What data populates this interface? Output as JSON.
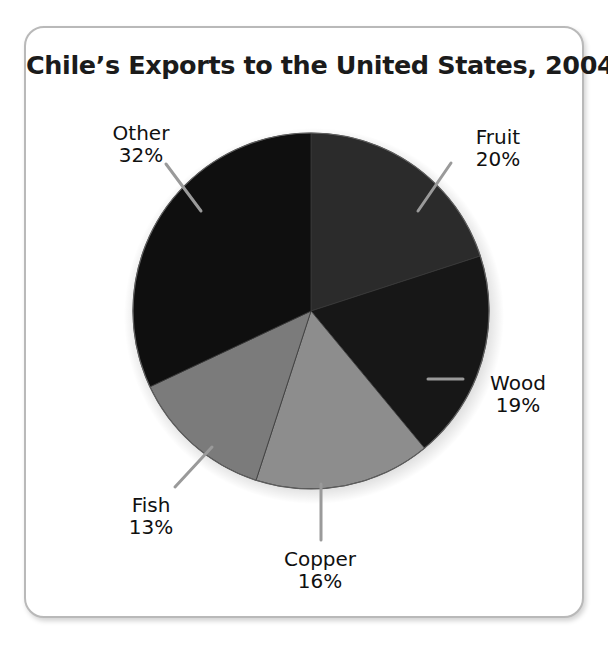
{
  "card": {
    "title": "Chile’s Exports to the United States, 2004"
  },
  "chart_data": {
    "type": "pie",
    "title": "Chile’s Exports to the United States, 2004",
    "xlabel": "",
    "ylabel": "",
    "unit": "percent",
    "start_angle_deg": 0,
    "direction": "clockwise",
    "legend": "none",
    "grid": false,
    "categories": [
      "Fruit",
      "Wood",
      "Copper",
      "Fish",
      "Other"
    ],
    "values": [
      20,
      19,
      16,
      13,
      32
    ],
    "labels": [
      "20%",
      "19%",
      "16%",
      "13%",
      "32%"
    ],
    "colors": [
      "#2b2b2b",
      "#171717",
      "#8d8d8d",
      "#7b7b7b",
      "#0f0f0f"
    ],
    "slices": [
      {
        "name": "Fruit",
        "value": 20,
        "label": "20%",
        "color": "#2b2b2b",
        "start_deg": 0,
        "end_deg": 72
      },
      {
        "name": "Wood",
        "value": 19,
        "label": "19%",
        "color": "#171717",
        "start_deg": 72,
        "end_deg": 140.4
      },
      {
        "name": "Copper",
        "value": 16,
        "label": "16%",
        "color": "#8d8d8d",
        "start_deg": 140.4,
        "end_deg": 197.999
      },
      {
        "name": "Fish",
        "value": 13,
        "label": "13%",
        "color": "#7b7b7b",
        "start_deg": 198,
        "end_deg": 244.8
      },
      {
        "name": "Other",
        "value": 32,
        "label": "32%",
        "color": "#0f0f0f",
        "start_deg": 244.8,
        "end_deg": 360
      }
    ],
    "total": 100
  },
  "labels": {
    "other": {
      "name": "Other",
      "pct": "32%"
    },
    "fruit": {
      "name": "Fruit",
      "pct": "20%"
    },
    "wood": {
      "name": "Wood",
      "pct": "19%"
    },
    "copper": {
      "name": "Copper",
      "pct": "16%"
    },
    "fish": {
      "name": "Fish",
      "pct": "13%"
    }
  }
}
